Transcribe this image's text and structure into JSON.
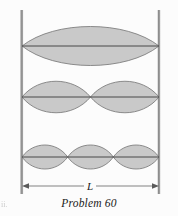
{
  "figure": {
    "caption": "Problem 60",
    "length_label": "L",
    "corner_artifact_text": "ii.",
    "background_color": "#fcfcfc",
    "wave_fill_color": "#c9c9c9",
    "wave_stroke_color": "#7a7a7a",
    "axis_line_color": "#3a3a3a",
    "wall_color": "#9a9a9a",
    "wall_highlight_color": "#cfcfcf",
    "dimension_line_color": "#6e6e6e",
    "caption_color": "#1a1a1a",
    "walls": {
      "left_x": 22,
      "right_x": 159,
      "top_y": 12,
      "bottom_y": 192
    },
    "dimension": {
      "y": 186,
      "start_x": 22,
      "end_x": 159,
      "label_x": 90
    },
    "harmonics": [
      {
        "name": "first-harmonic",
        "mode_number": 1,
        "antinodes": 1,
        "nodes": 2,
        "center_y": 46,
        "amplitude": 23,
        "node_positions": [
          22,
          159
        ]
      },
      {
        "name": "second-harmonic",
        "mode_number": 2,
        "antinodes": 2,
        "nodes": 3,
        "center_y": 97,
        "amplitude": 18,
        "node_positions": [
          22,
          90.5,
          159
        ]
      },
      {
        "name": "third-harmonic",
        "mode_number": 3,
        "antinodes": 3,
        "nodes": 4,
        "center_y": 157,
        "amplitude": 14,
        "node_positions": [
          22,
          67.67,
          113.33,
          159
        ]
      }
    ]
  }
}
